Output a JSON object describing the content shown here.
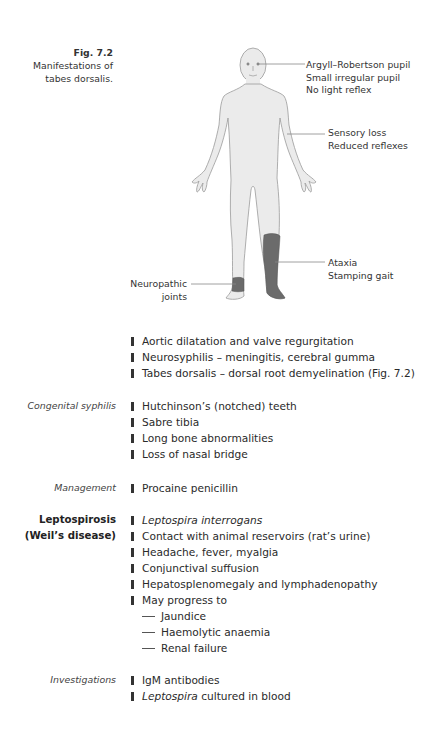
{
  "figure": {
    "number": "Fig. 7.2",
    "caption_line1": "Manifestations of",
    "caption_line2": "tabes dorsalis.",
    "callouts": {
      "eyes": [
        "Argyll–Robertson pupil",
        "Small irregular pupil",
        "No light reflex"
      ],
      "arm": [
        "Sensory loss",
        "Reduced reflexes"
      ],
      "leg": [
        "Ataxia",
        "Stamping gait"
      ],
      "ankle": [
        "Neuropathic",
        "joints"
      ]
    },
    "colors": {
      "body_fill": "#ebebeb",
      "body_stroke": "#9a9a9a",
      "highlight_fill": "#6b6b6b"
    }
  },
  "syphilis_tertiary": {
    "items": [
      "Aortic dilatation and valve regurgitation",
      "Neurosyphilis – meningitis, cerebral gumma",
      "Tabes dorsalis – dorsal root demyelination (Fig. 7.2)"
    ]
  },
  "congenital": {
    "label": "Congenital syphilis",
    "items": [
      "Hutchinson’s (notched) teeth",
      "Sabre tibia",
      "Long bone abnormalities",
      "Loss of nasal bridge"
    ]
  },
  "management": {
    "label": "Management",
    "items": [
      "Procaine penicillin"
    ]
  },
  "leptospirosis": {
    "label_line1": "Leptospirosis",
    "label_line2": "(Weil’s disease)",
    "items": [
      "Leptospira interrogans",
      "Contact with animal reservoirs (rat’s urine)",
      "Headache, fever, myalgia",
      "Conjunctival suffusion",
      "Hepatosplenomegaly and lymphadenopathy",
      "May progress to"
    ],
    "sub_items": [
      "Jaundice",
      "Haemolytic anaemia",
      "Renal failure"
    ]
  },
  "investigations": {
    "label": "Investigations",
    "item1": "IgM antibodies",
    "item2_italic": "Leptospira",
    "item2_rest": " cultured in blood"
  }
}
